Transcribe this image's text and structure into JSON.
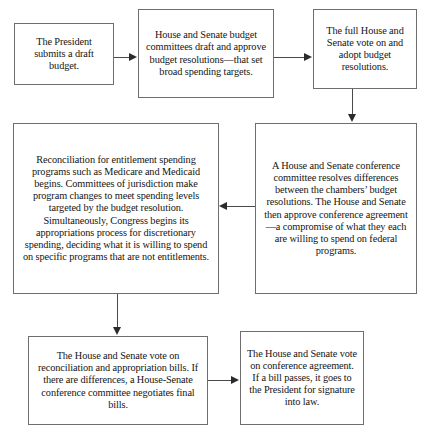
{
  "diagram": {
    "type": "flowchart",
    "background_color": "#ffffff",
    "border_color": "#6e6e6e",
    "text_color": "#141414",
    "arrow_color": "#2b2b2b",
    "nodes": [
      {
        "id": "president",
        "text": "The President submits a draft budget."
      },
      {
        "id": "committees",
        "text": "House and Senate budget committees draft and approve budget resolutions—that set broad spending targets."
      },
      {
        "id": "fullvote",
        "text": "The full House and Senate vote on and adopt budget resolutions."
      },
      {
        "id": "reconciliation",
        "text": "Reconciliation for entitlement spending programs such as Medicare and Medicaid begins. Committees of jurisdiction make program changes to meet spending levels targeted by the budget resolution. Simultaneously, Congress begins its appropriations process for discretionary spending, deciding what it is willing to spend on specific programs that are not entitlements."
      },
      {
        "id": "conference",
        "text": "A House and Senate conference committee resolves differences between the chambers’ budget resolutions. The House and Senate then approve conference agreement—a compromise of what they each are willing to spend on federal programs."
      },
      {
        "id": "votebills",
        "text": "The House and Senate vote on reconciliation and appropriation bills. If there are differences, a House-Senate conference committee negotiates final bills."
      },
      {
        "id": "signature",
        "text": "The House and Senate vote on conference agreement. If a bill passes, it goes to the President for signature into law."
      }
    ],
    "edges": [
      {
        "from": "president",
        "to": "committees",
        "direction": "right"
      },
      {
        "from": "committees",
        "to": "fullvote",
        "direction": "right"
      },
      {
        "from": "fullvote",
        "to": "conference",
        "direction": "down"
      },
      {
        "from": "conference",
        "to": "reconciliation",
        "direction": "left"
      },
      {
        "from": "reconciliation",
        "to": "votebills",
        "direction": "down"
      },
      {
        "from": "votebills",
        "to": "signature",
        "direction": "right"
      }
    ]
  }
}
